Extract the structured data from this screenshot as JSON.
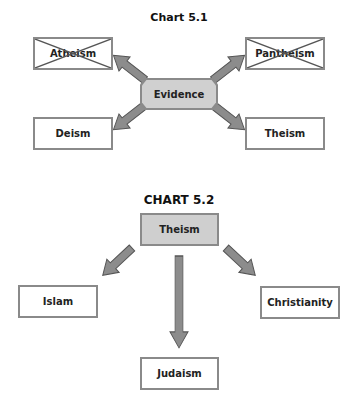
{
  "chart_5_1": {
    "title": "Chart 5.1",
    "center": {
      "label": "Evidence",
      "fill": "#d0d0d0"
    },
    "nodes": [
      {
        "id": "atheism",
        "label": "Atheism",
        "crossed_out": true
      },
      {
        "id": "pantheism",
        "label": "Pantheism",
        "crossed_out": true
      },
      {
        "id": "deism",
        "label": "Deism",
        "crossed_out": false
      },
      {
        "id": "theism",
        "label": "Theism",
        "crossed_out": false
      }
    ]
  },
  "chart_5_2": {
    "title": "CHART 5.2",
    "root": {
      "label": "Theism",
      "fill": "#cfcfcf"
    },
    "nodes": [
      {
        "id": "islam",
        "label": "Islam"
      },
      {
        "id": "judaism",
        "label": "Judaism"
      },
      {
        "id": "christianity",
        "label": "Christianity"
      }
    ]
  },
  "colors": {
    "border": "#8a8a8a",
    "arrow_fill": "#8c8c8c",
    "arrow_stroke": "#555555",
    "shade": "#d0d0d0"
  }
}
